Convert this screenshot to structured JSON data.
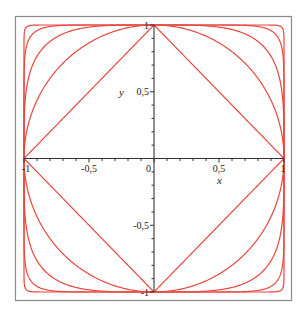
{
  "chart_data": {
    "type": "line",
    "title": "",
    "xlabel": "x",
    "ylabel": "y",
    "xlim": [
      -1,
      1
    ],
    "ylim": [
      -1,
      1
    ],
    "grid": false,
    "legend": null,
    "series": [
      {
        "name": "p=1",
        "exponent": 1
      },
      {
        "name": "p=2",
        "exponent": 2
      },
      {
        "name": "p=4",
        "exponent": 4
      },
      {
        "name": "p=10",
        "exponent": 10
      },
      {
        "name": "p=40",
        "exponent": 40
      }
    ],
    "x_ticks": [
      {
        "value": -1,
        "label": "-1"
      },
      {
        "value": -0.5,
        "label": "-0,5"
      },
      {
        "value": 0,
        "label": "0"
      },
      {
        "value": 0.5,
        "label": "0,5"
      },
      {
        "value": 1,
        "label": "1"
      }
    ],
    "y_ticks": [
      {
        "value": 1,
        "label": "1"
      },
      {
        "value": 0.5,
        "label": "0,5"
      },
      {
        "value": -0.5,
        "label": "-0,5"
      },
      {
        "value": -1,
        "label": "-1"
      }
    ],
    "minor_tick_step": 0.1
  },
  "style": {
    "curve_color": "#e8473f",
    "axis_color": "#333333",
    "frame_color": "#8a8a8a"
  },
  "labels": {
    "x_axis": "x",
    "y_axis": "y"
  }
}
